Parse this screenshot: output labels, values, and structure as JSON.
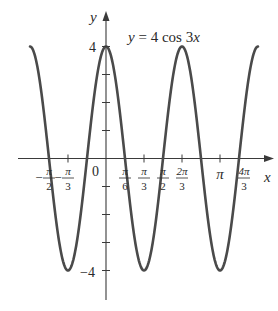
{
  "chart_data": {
    "type": "line",
    "title": "y = 4 cos 3x",
    "xlabel": "x",
    "ylabel": "y",
    "function": "y = 4*cos(3*x)",
    "x_range": [
      -2.0944,
      4.1888
    ],
    "xlim": [
      -2.3,
      4.65
    ],
    "ylim": [
      -5.2,
      5.2
    ],
    "grid": false,
    "x_ticks": [
      {
        "value": -1.5708,
        "label_num": "π",
        "label_den": "2",
        "neg": true
      },
      {
        "value": -1.0472,
        "label_num": "π",
        "label_den": "3",
        "neg": true
      },
      {
        "value": 0.5236,
        "label_num": "π",
        "label_den": "6",
        "neg": false
      },
      {
        "value": 1.0472,
        "label_num": "π",
        "label_den": "3",
        "neg": false
      },
      {
        "value": 1.5708,
        "label_num": "π",
        "label_den": "2",
        "neg": false
      },
      {
        "value": 2.0944,
        "label_num": "2π",
        "label_den": "3",
        "neg": false
      },
      {
        "value": 3.1416,
        "label": "π",
        "neg": false
      },
      {
        "value": 4.1888,
        "label_num": "4π",
        "label_den": "3",
        "neg": false
      }
    ],
    "y_ticks": [
      {
        "value": 4,
        "label": "4"
      },
      {
        "value": 3,
        "label": ""
      },
      {
        "value": 2,
        "label": ""
      },
      {
        "value": 1,
        "label": ""
      },
      {
        "value": -1,
        "label": ""
      },
      {
        "value": -2,
        "label": ""
      },
      {
        "value": -3,
        "label": ""
      },
      {
        "value": -4,
        "label": "−4"
      }
    ],
    "origin_label": "0",
    "maxima": [
      [
        -2.0944,
        4
      ],
      [
        0,
        4
      ],
      [
        2.0944,
        4
      ],
      [
        4.1888,
        4
      ]
    ],
    "minima": [
      [
        -1.0472,
        -4
      ],
      [
        1.0472,
        -4
      ],
      [
        3.1416,
        -4
      ]
    ],
    "zeros": [
      -1.5708,
      -0.5236,
      0.5236,
      1.5708,
      2.618,
      3.6652
    ]
  },
  "labels": {
    "title": "y = 4 cos 3x",
    "x_axis": "x",
    "y_axis": "y",
    "origin": "0",
    "y_max": "4",
    "y_min": "−4"
  },
  "colors": {
    "curve": "#4a4a4a",
    "axis": "#3a3a3a",
    "text": "#2a2a2a"
  }
}
